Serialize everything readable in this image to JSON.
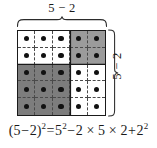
{
  "figure": {
    "type": "area-model-diagram",
    "width": 157,
    "height": 148
  },
  "labels": {
    "top": "5 − 2",
    "right": "5 − 2"
  },
  "braces": {
    "top_name": "horizontal-curly-brace",
    "right_name": "vertical-curly-brace"
  },
  "grid": {
    "rows": 5,
    "columns": 5,
    "total_dots": 25,
    "dot_color": "#111111",
    "outline_color": "#1a1a1a",
    "dash_color": "#4a4a4a",
    "quadrants": [
      {
        "name": "top-left",
        "fill_class": "fill-white",
        "fill_color": "#ffffff",
        "cols": 3,
        "rows": 2,
        "dots": 6
      },
      {
        "name": "top-right",
        "fill_class": "fill-light",
        "fill_color": "#9b9b9b",
        "cols": 2,
        "rows": 2,
        "dots": 4
      },
      {
        "name": "bottom-left",
        "fill_class": "fill-dark",
        "fill_color": "#7d7d7d",
        "cols": 3,
        "rows": 3,
        "dots": 9
      },
      {
        "name": "bottom-right",
        "fill_class": "fill-white",
        "fill_color": "#ffffff",
        "cols": 2,
        "rows": 3,
        "dots": 6
      }
    ],
    "cell_fills": [
      [
        "fill-white",
        "fill-white",
        "fill-white",
        "fill-light",
        "fill-light"
      ],
      [
        "fill-white",
        "fill-white",
        "fill-white",
        "fill-light",
        "fill-light"
      ],
      [
        "fill-dark",
        "fill-dark",
        "fill-dark",
        "fill-white",
        "fill-white"
      ],
      [
        "fill-dark",
        "fill-dark",
        "fill-dark",
        "fill-white",
        "fill-white"
      ],
      [
        "fill-dark",
        "fill-dark",
        "fill-dark",
        "fill-white",
        "fill-white"
      ]
    ]
  },
  "formula": {
    "full_text": "(5 − 2)² = 5² − 2 × 5 × 2 + 2²",
    "lhs_open": "(5",
    "lhs_minus": "−",
    "lhs_two": "2)",
    "exp_lhs": "2",
    "equals": "=",
    "term1_base": "5",
    "term1_exp": "2",
    "minus": "−",
    "term2": "2 × 5 × 2",
    "plus": "+",
    "term3_base": "2",
    "term3_exp": "2"
  }
}
